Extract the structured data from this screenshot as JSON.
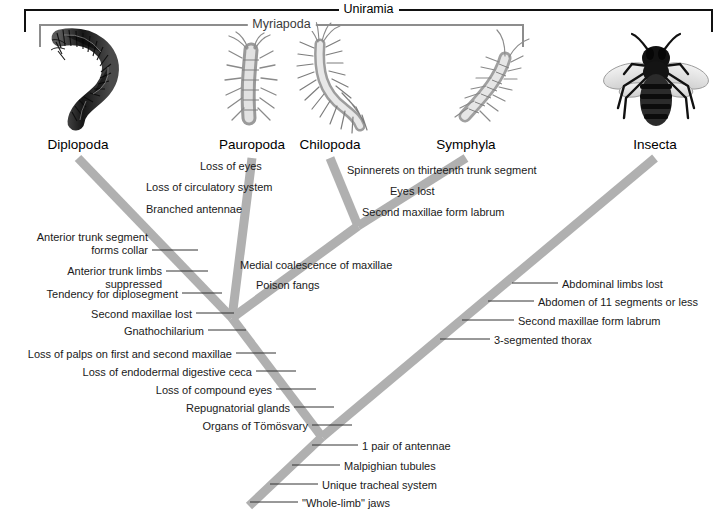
{
  "figure": {
    "type": "cladogram",
    "title_brackets": [
      {
        "name": "uniramia",
        "label": "Uniramia",
        "x1": 25,
        "x2": 712,
        "y": 10,
        "color": "#111111"
      },
      {
        "name": "myriapoda",
        "label": "Myriapoda",
        "x1": 40,
        "x2": 523,
        "y": 25,
        "color": "#8d8d8d"
      }
    ],
    "taxa": [
      {
        "id": "diplopoda",
        "label": "Diplopoda",
        "x": 78,
        "y": 137,
        "icon": "millipede-illustration"
      },
      {
        "id": "pauropoda",
        "label": "Pauropoda",
        "x": 252,
        "y": 137,
        "icon": "pauropod-illustration"
      },
      {
        "id": "chilopoda",
        "label": "Chilopoda",
        "x": 330,
        "y": 137,
        "icon": "centipede-illustration"
      },
      {
        "id": "symphyla",
        "label": "Symphyla",
        "x": 466,
        "y": 137,
        "icon": "symphylan-illustration"
      },
      {
        "id": "insecta",
        "label": "Insecta",
        "x": 655,
        "y": 137,
        "icon": "honeybee-illustration"
      }
    ],
    "branch_color": "#b0b0b0",
    "branch_width": 9,
    "branches": [
      {
        "name": "branch-diplopoda",
        "x1": 78,
        "y1": 158,
        "x2": 232,
        "y2": 318
      },
      {
        "name": "branch-pauropoda",
        "x1": 252,
        "y1": 158,
        "x2": 232,
        "y2": 318
      },
      {
        "name": "branch-chilopoda",
        "x1": 330,
        "y1": 158,
        "x2": 358,
        "y2": 226
      },
      {
        "name": "branch-symphyla",
        "x1": 466,
        "y1": 158,
        "x2": 358,
        "y2": 226
      },
      {
        "name": "branch-myriapod-node",
        "x1": 358,
        "y1": 226,
        "x2": 232,
        "y2": 318
      },
      {
        "name": "branch-myriapoda-stem",
        "x1": 232,
        "y1": 318,
        "x2": 322,
        "y2": 437
      },
      {
        "name": "branch-insecta",
        "x1": 655,
        "y1": 158,
        "x2": 322,
        "y2": 437
      },
      {
        "name": "branch-root-stem",
        "x1": 322,
        "y1": 437,
        "x2": 249,
        "y2": 506
      }
    ],
    "character_groups": [
      {
        "name": "pauropoda-apomorphies",
        "align": "left",
        "leader": false,
        "items": [
          {
            "text": "Loss of eyes",
            "x": 200,
            "y": 160
          },
          {
            "text": "Loss of circulatory system",
            "x": 146,
            "y": 181
          },
          {
            "text": "Branched antennae",
            "x": 146,
            "y": 203
          }
        ]
      },
      {
        "name": "symphyla-apomorphies",
        "align": "left",
        "leader": false,
        "items": [
          {
            "text": "Spinnerets on thirteenth trunk segment",
            "x": 347,
            "y": 164
          },
          {
            "text": "Eyes lost",
            "x": 390,
            "y": 185
          },
          {
            "text": "Second maxillae form labrum",
            "x": 362,
            "y": 206
          }
        ]
      },
      {
        "name": "diplopoda-apomorphies",
        "align": "right",
        "leader": true,
        "items": [
          {
            "text": "Anterior trunk segment",
            "x": 148,
            "y": 231,
            "leader_x1": 150,
            "leader_x2": 150,
            "leader_y": 0
          },
          {
            "text": "forms collar",
            "x": 148,
            "y": 244,
            "leader_x1": 152,
            "leader_x2": 198,
            "leader_y": 250
          },
          {
            "text": "Anterior trunk limbs",
            "x": 162,
            "y": 265,
            "leader_x1": 166,
            "leader_x2": 208,
            "leader_y": 271
          },
          {
            "text": "suppressed",
            "x": 162,
            "y": 278,
            "leader_x1": 0,
            "leader_x2": 0,
            "leader_y": 0
          },
          {
            "text": "Tendency for diplosegment",
            "x": 178,
            "y": 288,
            "leader_x1": 182,
            "leader_x2": 222,
            "leader_y": 293
          },
          {
            "text": "Second maxillae lost",
            "x": 192,
            "y": 308,
            "leader_x1": 196,
            "leader_x2": 234,
            "leader_y": 313
          },
          {
            "text": "Gnathochilarium",
            "x": 204,
            "y": 325,
            "leader_x1": 208,
            "leader_x2": 246,
            "leader_y": 330
          }
        ]
      },
      {
        "name": "chilopoda-symphyla-apomorphies",
        "align": "left",
        "leader": false,
        "items": [
          {
            "text": "Medial coalescence of maxillae",
            "x": 240,
            "y": 259
          },
          {
            "text": "Poison fangs",
            "x": 256,
            "y": 279
          }
        ]
      },
      {
        "name": "myriapoda-apomorphies",
        "align": "right",
        "leader": true,
        "items": [
          {
            "text": "Loss of palps on first and second maxillae",
            "x": 232,
            "y": 348,
            "leader_x1": 236,
            "leader_x2": 276,
            "leader_y": 353
          },
          {
            "text": "Loss of endodermal digestive ceca",
            "x": 252,
            "y": 366,
            "leader_x1": 256,
            "leader_x2": 296,
            "leader_y": 371
          },
          {
            "text": "Loss of compound eyes",
            "x": 272,
            "y": 384,
            "leader_x1": 276,
            "leader_x2": 316,
            "leader_y": 389
          },
          {
            "text": "Repugnatorial glands",
            "x": 290,
            "y": 402,
            "leader_x1": 294,
            "leader_x2": 334,
            "leader_y": 407
          },
          {
            "text": "Organs of Tömösvary",
            "x": 308,
            "y": 420,
            "leader_x1": 312,
            "leader_x2": 352,
            "leader_y": 425
          }
        ]
      },
      {
        "name": "insecta-apomorphies",
        "align": "left",
        "leader": true,
        "items": [
          {
            "text": "Abdominal limbs lost",
            "x": 562,
            "y": 278,
            "leader_x1": 512,
            "leader_x2": 558,
            "leader_y": 283
          },
          {
            "text": "Abdomen of 11 segments or less",
            "x": 538,
            "y": 296,
            "leader_x1": 488,
            "leader_x2": 534,
            "leader_y": 301
          },
          {
            "text": "Second maxillae form labrum",
            "x": 518,
            "y": 315,
            "leader_x1": 462,
            "leader_x2": 514,
            "leader_y": 320
          },
          {
            "text": "3-segmented thorax",
            "x": 494,
            "y": 334,
            "leader_x1": 440,
            "leader_x2": 490,
            "leader_y": 339
          }
        ]
      },
      {
        "name": "uniramia-apomorphies",
        "align": "left",
        "leader": true,
        "items": [
          {
            "text": "1 pair of antennae",
            "x": 362,
            "y": 440,
            "leader_x1": 312,
            "leader_x2": 358,
            "leader_y": 445
          },
          {
            "text": "Malpighian tubules",
            "x": 344,
            "y": 460,
            "leader_x1": 292,
            "leader_x2": 340,
            "leader_y": 465
          },
          {
            "text": "Unique tracheal system",
            "x": 322,
            "y": 479,
            "leader_x1": 270,
            "leader_x2": 318,
            "leader_y": 484
          },
          {
            "text": "\"Whole-limb\" jaws",
            "x": 302,
            "y": 497,
            "leader_x1": 250,
            "leader_x2": 298,
            "leader_y": 502
          }
        ]
      }
    ]
  }
}
